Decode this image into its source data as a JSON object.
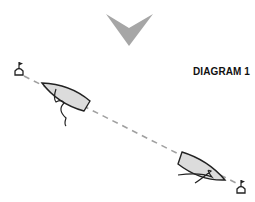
{
  "diagram": {
    "title": "DIAGRAM 1",
    "elements": {
      "wind_arrow": {
        "direction": "down",
        "color": "#a6a6a6"
      },
      "layline": {
        "style": "dashed",
        "color": "#a0a0a0"
      },
      "marks": [
        {
          "name": "mark-left"
        },
        {
          "name": "mark-right"
        }
      ],
      "boats": [
        {
          "name": "boat-upper-left",
          "fill": "#dcdcdc"
        },
        {
          "name": "boat-lower-right",
          "fill": "#dcdcdc"
        }
      ]
    }
  }
}
